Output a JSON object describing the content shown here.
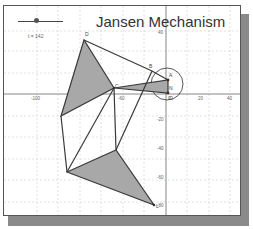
{
  "title": "Jansen Mechanism",
  "slider": {
    "label": "t = 142",
    "value": 142
  },
  "axes": {
    "x_ticks": [
      "-100",
      "-80",
      "-60",
      "-40",
      "-20",
      "0",
      "20",
      "40"
    ],
    "y_ticks": [
      "40",
      "20",
      "-20",
      "-40",
      "-60",
      "-80"
    ]
  },
  "points": {
    "D": "D",
    "A": "A",
    "N": "N",
    "O": "O",
    "C": "C",
    "E": "E",
    "F": "F",
    "B": "B",
    "G": "G",
    "H": "H",
    "L": "L"
  },
  "colors": {
    "fill": "#a8a8a8",
    "line": "#3a3a3a",
    "grid": "#cfcfcf",
    "shadow": "#8a8a8a"
  }
}
